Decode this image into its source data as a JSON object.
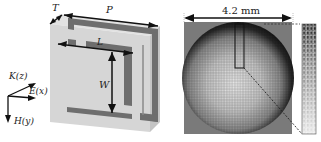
{
  "figure": {
    "left_panel": {
      "description": "3D unit cell with split-ring resonator",
      "dimension_labels": {
        "thickness": "T",
        "period": "P",
        "length": "L",
        "width": "W"
      },
      "axes": {
        "k": "K(z)",
        "e": "E(x)",
        "h": "H(y)"
      },
      "colors": {
        "substrate_face": "#d4d4d4",
        "substrate_side": "#bcbcbc",
        "substrate_top": "#e2e2e2",
        "metal": "#6e6e6e"
      }
    },
    "right_panel": {
      "description": "Gradient lens array of unit cells",
      "scale_label": "4.2 mm",
      "grid_cells": 40,
      "strip_rows": 24,
      "strip_cols": 3,
      "colors": {
        "background": "#7a7a7a",
        "dark": "#1e1e1e",
        "light": "#e8e8e8"
      }
    }
  }
}
